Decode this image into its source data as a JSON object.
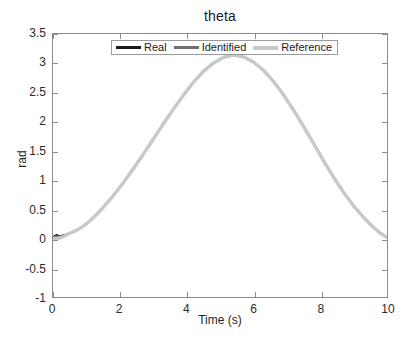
{
  "chart_data": {
    "type": "line",
    "title": "theta",
    "xlabel": "Time (s)",
    "ylabel": "rad",
    "xlim": [
      0,
      10
    ],
    "ylim": [
      -1,
      3.5
    ],
    "grid": false,
    "legend_position": "top-center-inside",
    "xticks": [
      0,
      2,
      4,
      6,
      8,
      10
    ],
    "xtick_labels": [
      "0",
      "2",
      "4",
      "6",
      "8",
      "10"
    ],
    "yticks": [
      -1,
      -0.5,
      0,
      0.5,
      1,
      1.5,
      2,
      2.5,
      3,
      3.5
    ],
    "ytick_labels": [
      "-1",
      "-0.5",
      "0",
      "0.5",
      "1",
      "1.5",
      "2",
      "2.5",
      "3",
      "3.5"
    ],
    "x": [
      0,
      0.1,
      0.2,
      0.3,
      0.4,
      0.5,
      0.7,
      0.9,
      1.1,
      1.3,
      1.5,
      1.8,
      2.1,
      2.4,
      2.7,
      3.0,
      3.3,
      3.6,
      3.9,
      4.2,
      4.5,
      4.8,
      5.1,
      5.4,
      5.7,
      6.0,
      6.3,
      6.6,
      6.9,
      7.2,
      7.5,
      7.8,
      8.1,
      8.4,
      8.7,
      9.0,
      9.3,
      9.6,
      9.8,
      10
    ],
    "series": [
      {
        "name": "Real",
        "color": "#1a1a1a",
        "values": [
          0.02,
          0.06,
          0.03,
          0.05,
          0.07,
          0.09,
          0.14,
          0.21,
          0.3,
          0.41,
          0.53,
          0.73,
          0.95,
          1.19,
          1.44,
          1.7,
          1.96,
          2.21,
          2.45,
          2.67,
          2.86,
          3.0,
          3.1,
          3.14,
          3.11,
          3.02,
          2.88,
          2.69,
          2.46,
          2.2,
          1.92,
          1.63,
          1.33,
          1.05,
          0.79,
          0.56,
          0.36,
          0.19,
          0.09,
          0.02
        ]
      },
      {
        "name": "Identified",
        "color": "#707070",
        "values": [
          0.01,
          0.04,
          0.02,
          0.04,
          0.06,
          0.09,
          0.14,
          0.21,
          0.3,
          0.41,
          0.53,
          0.73,
          0.95,
          1.19,
          1.44,
          1.7,
          1.96,
          2.21,
          2.45,
          2.67,
          2.86,
          3.0,
          3.1,
          3.14,
          3.11,
          3.02,
          2.88,
          2.69,
          2.46,
          2.2,
          1.92,
          1.63,
          1.33,
          1.05,
          0.79,
          0.56,
          0.36,
          0.19,
          0.09,
          0.02
        ]
      },
      {
        "name": "Reference",
        "color": "#c9c9c9",
        "values": [
          0.0,
          0.0,
          0.01,
          0.03,
          0.06,
          0.09,
          0.14,
          0.21,
          0.3,
          0.41,
          0.53,
          0.73,
          0.95,
          1.19,
          1.44,
          1.7,
          1.96,
          2.21,
          2.45,
          2.67,
          2.86,
          3.0,
          3.1,
          3.14,
          3.11,
          3.02,
          2.88,
          2.69,
          2.46,
          2.2,
          1.92,
          1.63,
          1.33,
          1.05,
          0.79,
          0.56,
          0.36,
          0.19,
          0.09,
          0.02
        ]
      }
    ],
    "annotations": []
  },
  "legend": {
    "entries": [
      {
        "label": "Real"
      },
      {
        "label": "Identified"
      },
      {
        "label": "Reference"
      }
    ]
  },
  "colors": {
    "axis": "#8c8c8c",
    "text": "#1f1f1f",
    "background": "#ffffff"
  }
}
